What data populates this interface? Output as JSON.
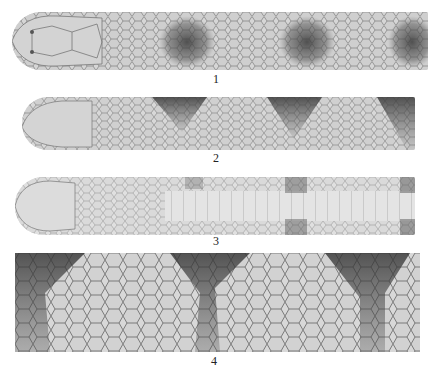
{
  "plate": {
    "figures": [
      {
        "id": "1",
        "label": "1",
        "view": "dorsal head and anterior body",
        "blotches": 3
      },
      {
        "id": "2",
        "label": "2",
        "view": "lateral head and anterior body",
        "blotches": 3
      },
      {
        "id": "3",
        "label": "3",
        "view": "ventral head and anterior body",
        "blotches": 3
      },
      {
        "id": "4",
        "label": "4",
        "view": "midbody scale pattern",
        "blotches": 3
      }
    ]
  },
  "colors": {
    "background": "#ffffff",
    "skin": "#d6d6d6",
    "scale_edge": "#7a7a7a",
    "blotch": "#4a4a4a"
  }
}
